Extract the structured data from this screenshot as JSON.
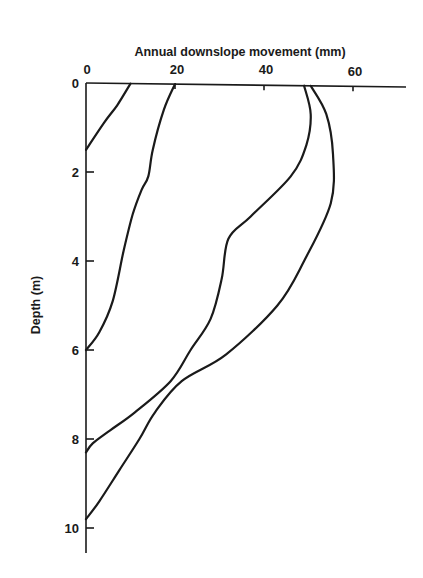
{
  "chart_data": {
    "type": "line",
    "title": "",
    "xlabel": "Annual downslope movement (mm)",
    "ylabel": "Depth (m)",
    "x_axis_position": "top",
    "y_axis_inverted": true,
    "xlim": [
      0,
      72
    ],
    "ylim": [
      0,
      10.5
    ],
    "x_ticks": [
      0,
      20,
      40,
      60
    ],
    "y_ticks": [
      0,
      2,
      4,
      6,
      8,
      10
    ],
    "grid": false,
    "legend": null,
    "series": [
      {
        "name": "profile-1",
        "points": [
          [
            10,
            0
          ],
          [
            7,
            0.5
          ],
          [
            4,
            0.9
          ],
          [
            0,
            1.5
          ]
        ]
      },
      {
        "name": "profile-2",
        "points": [
          [
            20,
            0
          ],
          [
            17.5,
            0.6
          ],
          [
            15,
            1.5
          ],
          [
            14,
            2.1
          ],
          [
            12.5,
            2.4
          ],
          [
            10.5,
            2.95
          ],
          [
            8.5,
            3.75
          ],
          [
            6,
            4.9
          ],
          [
            3,
            5.6
          ],
          [
            0,
            6.0
          ]
        ]
      },
      {
        "name": "profile-3",
        "points": [
          [
            49,
            0
          ],
          [
            50.5,
            0.7
          ],
          [
            49.5,
            1.4
          ],
          [
            46,
            2.1
          ],
          [
            37,
            3.0
          ],
          [
            32,
            3.5
          ],
          [
            30.5,
            4.4
          ],
          [
            28,
            5.3
          ],
          [
            23.5,
            6.0
          ],
          [
            19,
            6.7
          ],
          [
            11,
            7.4
          ],
          [
            5.5,
            7.8
          ],
          [
            1.5,
            8.1
          ],
          [
            0,
            8.3
          ]
        ]
      },
      {
        "name": "profile-4",
        "points": [
          [
            50.5,
            0
          ],
          [
            54,
            0.7
          ],
          [
            55.5,
            1.6
          ],
          [
            55,
            2.7
          ],
          [
            49,
            4.0
          ],
          [
            43,
            5.0
          ],
          [
            31.5,
            6.1
          ],
          [
            21.5,
            6.7
          ],
          [
            15.5,
            7.4
          ],
          [
            12,
            8.0
          ],
          [
            7.5,
            8.7
          ],
          [
            3,
            9.4
          ],
          [
            0,
            9.8
          ]
        ]
      }
    ]
  },
  "labels": {
    "x_title": "Annual downslope movement (mm)",
    "y_title": "Depth (m)",
    "x_tick_labels": [
      "0",
      "20",
      "40",
      "60"
    ],
    "y_tick_labels": [
      "0",
      "2",
      "4",
      "6",
      "8",
      "10"
    ]
  }
}
